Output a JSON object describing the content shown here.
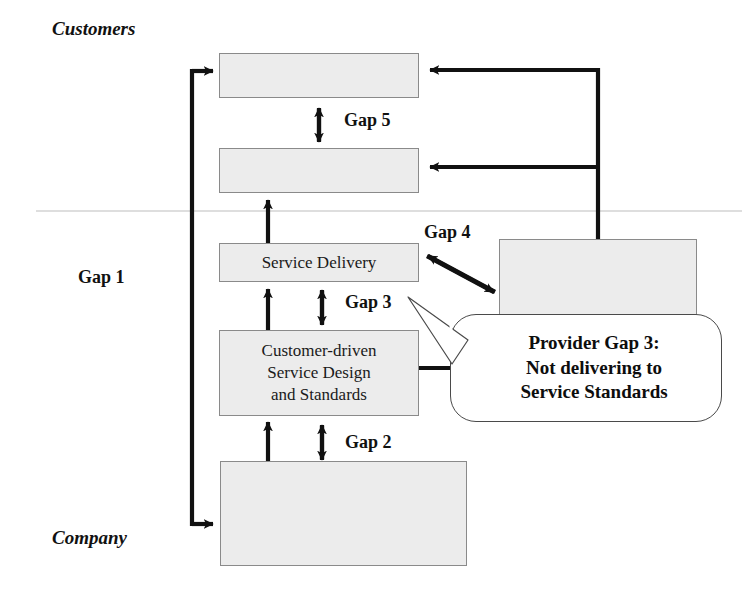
{
  "diagram": {
    "zones": {
      "top_label": "Customers",
      "bottom_label": "Company"
    },
    "divider": {
      "name": "customer-company-divider",
      "color": "#b9b9b9"
    },
    "boxes": [
      {
        "id": "customer-expectations",
        "text": ""
      },
      {
        "id": "customer-perceptions",
        "text": ""
      },
      {
        "id": "service-delivery",
        "text": "Service Delivery"
      },
      {
        "id": "service-design",
        "text": "Customer-driven\nService Design\nand Standards"
      },
      {
        "id": "company-perceptions",
        "text": ""
      },
      {
        "id": "external-communications",
        "text": ""
      }
    ],
    "gaps": {
      "gap1": "Gap 1",
      "gap2": "Gap 2",
      "gap3": "Gap 3",
      "gap4": "Gap 4",
      "gap5": "Gap 5"
    },
    "callout": {
      "id": "provider-gap-3",
      "text": "Provider Gap 3:\nNot delivering to\nService Standards"
    },
    "colors": {
      "box_fill": "#ececec",
      "box_border": "#8a8a8a",
      "line": "#111111",
      "divider": "#b9b9b9",
      "callout_fill": "#ffffff",
      "callout_border": "#4a4a4a",
      "text": "#111111",
      "background": "#ffffff"
    }
  }
}
